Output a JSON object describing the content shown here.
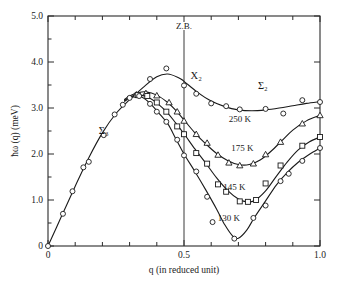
{
  "chart_data": {
    "type": "line",
    "title": "",
    "xlabel": "q (in reduced unit)",
    "ylabel": "ħω (q) (meV)",
    "xlim": [
      0,
      1.0
    ],
    "ylim": [
      0,
      5.0
    ],
    "xticks": [
      0,
      0.1,
      0.2,
      0.3,
      0.4,
      0.5,
      0.6,
      0.7,
      0.8,
      0.9,
      1.0
    ],
    "xticklabels": [
      "0",
      "",
      "",
      "",
      "",
      "0.5",
      "",
      "",
      "",
      "",
      "1.0"
    ],
    "yticks": [
      0,
      1.0,
      2.0,
      3.0,
      4.0,
      5.0
    ],
    "yticklabels": [
      "0",
      "1.0",
      "2.0",
      "3.0",
      "4.0",
      "5.0"
    ],
    "grid": false,
    "legend_position": "inline-labels",
    "annotations": [
      {
        "text": "Z.B.",
        "x": 0.5,
        "y": 4.72,
        "name": "zone-boundary-label"
      },
      {
        "text": "Σ₃",
        "x": 0.205,
        "y": 2.43,
        "name": "sigma3-branch-label"
      },
      {
        "text": "X₂",
        "x": 0.545,
        "y": 3.62,
        "name": "x2-point-label"
      },
      {
        "text": "Σ₂",
        "x": 0.79,
        "y": 3.42,
        "name": "sigma2-branch-label"
      },
      {
        "text": "250 K",
        "x": 0.705,
        "y": 2.69,
        "name": "series-label-250k"
      },
      {
        "text": "175 K",
        "x": 0.715,
        "y": 2.06,
        "name": "series-label-175k"
      },
      {
        "text": "145 K",
        "x": 0.685,
        "y": 1.22,
        "name": "series-label-145k"
      },
      {
        "text": "130 K",
        "x": 0.665,
        "y": 0.55,
        "name": "series-label-130k"
      }
    ],
    "series": [
      {
        "name": "250 K",
        "marker": "circle",
        "points": [
          {
            "x": 0.0,
            "y": 0.0
          },
          {
            "x": 0.055,
            "y": 0.7
          },
          {
            "x": 0.09,
            "y": 1.19
          },
          {
            "x": 0.13,
            "y": 1.71
          },
          {
            "x": 0.15,
            "y": 1.83
          },
          {
            "x": 0.205,
            "y": 2.41
          },
          {
            "x": 0.245,
            "y": 2.86
          },
          {
            "x": 0.275,
            "y": 3.07
          },
          {
            "x": 0.3,
            "y": 3.22
          },
          {
            "x": 0.325,
            "y": 3.28
          },
          {
            "x": 0.375,
            "y": 3.63
          },
          {
            "x": 0.435,
            "y": 3.86
          },
          {
            "x": 0.5,
            "y": 3.49
          },
          {
            "x": 0.545,
            "y": 3.31
          },
          {
            "x": 0.6,
            "y": 3.1
          },
          {
            "x": 0.655,
            "y": 3.04
          },
          {
            "x": 0.705,
            "y": 2.97
          },
          {
            "x": 0.8,
            "y": 2.98
          },
          {
            "x": 0.865,
            "y": 2.88
          },
          {
            "x": 0.935,
            "y": 3.17
          },
          {
            "x": 1.0,
            "y": 3.13
          }
        ],
        "curve": [
          [
            0.0,
            0.0
          ],
          [
            0.05,
            0.65
          ],
          [
            0.1,
            1.3
          ],
          [
            0.15,
            1.92
          ],
          [
            0.2,
            2.46
          ],
          [
            0.25,
            2.88
          ],
          [
            0.3,
            3.18
          ],
          [
            0.35,
            3.45
          ],
          [
            0.4,
            3.68
          ],
          [
            0.44,
            3.74
          ],
          [
            0.48,
            3.66
          ],
          [
            0.5,
            3.58
          ],
          [
            0.55,
            3.34
          ],
          [
            0.6,
            3.15
          ],
          [
            0.65,
            3.03
          ],
          [
            0.7,
            2.96
          ],
          [
            0.75,
            2.94
          ],
          [
            0.8,
            2.96
          ],
          [
            0.85,
            3.0
          ],
          [
            0.9,
            3.05
          ],
          [
            0.95,
            3.1
          ],
          [
            1.0,
            3.14
          ]
        ]
      },
      {
        "name": "175 K",
        "marker": "triangle",
        "points": [
          {
            "x": 0.325,
            "y": 3.29
          },
          {
            "x": 0.36,
            "y": 3.32
          },
          {
            "x": 0.4,
            "y": 3.27
          },
          {
            "x": 0.445,
            "y": 3.12
          },
          {
            "x": 0.475,
            "y": 2.92
          },
          {
            "x": 0.5,
            "y": 2.72
          },
          {
            "x": 0.545,
            "y": 2.43
          },
          {
            "x": 0.585,
            "y": 2.24
          },
          {
            "x": 0.625,
            "y": 1.98
          },
          {
            "x": 0.665,
            "y": 1.81
          },
          {
            "x": 0.705,
            "y": 1.75
          },
          {
            "x": 0.755,
            "y": 1.79
          },
          {
            "x": 0.8,
            "y": 1.99
          },
          {
            "x": 0.855,
            "y": 2.26
          },
          {
            "x": 0.935,
            "y": 2.66
          },
          {
            "x": 1.0,
            "y": 2.84
          }
        ],
        "curve": [
          [
            0.28,
            3.18
          ],
          [
            0.3,
            3.26
          ],
          [
            0.33,
            3.33
          ],
          [
            0.36,
            3.35
          ],
          [
            0.4,
            3.28
          ],
          [
            0.44,
            3.12
          ],
          [
            0.47,
            2.95
          ],
          [
            0.5,
            2.74
          ],
          [
            0.54,
            2.46
          ],
          [
            0.58,
            2.22
          ],
          [
            0.62,
            2.01
          ],
          [
            0.66,
            1.86
          ],
          [
            0.7,
            1.77
          ],
          [
            0.74,
            1.77
          ],
          [
            0.78,
            1.87
          ],
          [
            0.82,
            2.06
          ],
          [
            0.86,
            2.29
          ],
          [
            0.9,
            2.52
          ],
          [
            0.95,
            2.72
          ],
          [
            1.0,
            2.84
          ]
        ]
      },
      {
        "name": "145 K",
        "marker": "square",
        "points": [
          {
            "x": 0.33,
            "y": 3.28
          },
          {
            "x": 0.365,
            "y": 3.26
          },
          {
            "x": 0.4,
            "y": 3.12
          },
          {
            "x": 0.435,
            "y": 2.92
          },
          {
            "x": 0.475,
            "y": 2.6
          },
          {
            "x": 0.5,
            "y": 2.43
          },
          {
            "x": 0.545,
            "y": 2.02
          },
          {
            "x": 0.585,
            "y": 1.79
          },
          {
            "x": 0.625,
            "y": 1.34
          },
          {
            "x": 0.655,
            "y": 1.18
          },
          {
            "x": 0.705,
            "y": 0.97
          },
          {
            "x": 0.735,
            "y": 0.96
          },
          {
            "x": 0.765,
            "y": 1.0
          },
          {
            "x": 0.8,
            "y": 1.36
          },
          {
            "x": 0.855,
            "y": 1.75
          },
          {
            "x": 0.935,
            "y": 2.18
          },
          {
            "x": 1.0,
            "y": 2.37
          }
        ],
        "curve": [
          [
            0.28,
            3.16
          ],
          [
            0.31,
            3.26
          ],
          [
            0.34,
            3.28
          ],
          [
            0.37,
            3.23
          ],
          [
            0.4,
            3.11
          ],
          [
            0.44,
            2.89
          ],
          [
            0.47,
            2.67
          ],
          [
            0.5,
            2.44
          ],
          [
            0.54,
            2.11
          ],
          [
            0.58,
            1.8
          ],
          [
            0.62,
            1.48
          ],
          [
            0.66,
            1.21
          ],
          [
            0.7,
            1.02
          ],
          [
            0.73,
            0.96
          ],
          [
            0.76,
            0.99
          ],
          [
            0.8,
            1.2
          ],
          [
            0.84,
            1.52
          ],
          [
            0.88,
            1.83
          ],
          [
            0.92,
            2.09
          ],
          [
            0.96,
            2.26
          ],
          [
            1.0,
            2.37
          ]
        ]
      },
      {
        "name": "130 K",
        "marker": "circle",
        "points": [
          {
            "x": 0.335,
            "y": 3.26
          },
          {
            "x": 0.375,
            "y": 3.09
          },
          {
            "x": 0.4,
            "y": 2.92
          },
          {
            "x": 0.435,
            "y": 2.7
          },
          {
            "x": 0.475,
            "y": 2.31
          },
          {
            "x": 0.5,
            "y": 1.97
          },
          {
            "x": 0.545,
            "y": 1.62
          },
          {
            "x": 0.585,
            "y": 1.07
          },
          {
            "x": 0.605,
            "y": 0.52
          },
          {
            "x": 0.685,
            "y": 0.16
          },
          {
            "x": 0.755,
            "y": 0.61
          },
          {
            "x": 0.8,
            "y": 0.88
          },
          {
            "x": 0.855,
            "y": 1.41
          },
          {
            "x": 0.885,
            "y": 1.57
          },
          {
            "x": 0.935,
            "y": 1.85
          },
          {
            "x": 1.0,
            "y": 2.13
          }
        ],
        "curve": [
          [
            0.28,
            3.14
          ],
          [
            0.31,
            3.24
          ],
          [
            0.34,
            3.25
          ],
          [
            0.37,
            3.13
          ],
          [
            0.4,
            2.94
          ],
          [
            0.44,
            2.66
          ],
          [
            0.47,
            2.33
          ],
          [
            0.5,
            2.0
          ],
          [
            0.54,
            1.62
          ],
          [
            0.58,
            1.22
          ],
          [
            0.62,
            0.8
          ],
          [
            0.65,
            0.46
          ],
          [
            0.68,
            0.21
          ],
          [
            0.7,
            0.17
          ],
          [
            0.73,
            0.34
          ],
          [
            0.76,
            0.63
          ],
          [
            0.8,
            0.98
          ],
          [
            0.84,
            1.33
          ],
          [
            0.88,
            1.6
          ],
          [
            0.92,
            1.82
          ],
          [
            0.96,
            1.99
          ],
          [
            1.0,
            2.13
          ]
        ]
      }
    ]
  }
}
